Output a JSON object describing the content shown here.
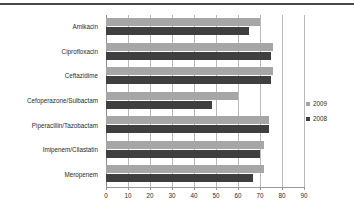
{
  "chart_data": {
    "type": "bar",
    "orientation": "horizontal",
    "title": "",
    "subtitle": "",
    "xlabel": "",
    "ylabel": "",
    "xlim": [
      0,
      90
    ],
    "xticks": [
      0,
      10,
      20,
      30,
      40,
      50,
      60,
      70,
      80,
      90
    ],
    "xtick_labels": [
      "0",
      "10",
      "20",
      "30",
      "40",
      "50",
      "60",
      "70",
      "80",
      "90"
    ],
    "grid": true,
    "grid_axis": "x",
    "legend_position": "right",
    "categories": [
      "Amikacin",
      "Ciprofloxacin",
      "Ceftazidime",
      "Cefoperazone/Sulbactam",
      "Piperacillin/Tazobactam",
      "Imipenem/Cilastatin",
      "Meropenem"
    ],
    "series": [
      {
        "name": "2009",
        "color": "#a6a6a6",
        "values": [
          70,
          76,
          76,
          60,
          74,
          72,
          72
        ]
      },
      {
        "name": "2008",
        "color": "#3f3f3f",
        "values": [
          65,
          75,
          75,
          48,
          74,
          70,
          67
        ]
      }
    ]
  },
  "legend": {
    "items": [
      {
        "label": "2009",
        "color": "#a6a6a6"
      },
      {
        "label": "2008",
        "color": "#3f3f3f"
      }
    ]
  }
}
